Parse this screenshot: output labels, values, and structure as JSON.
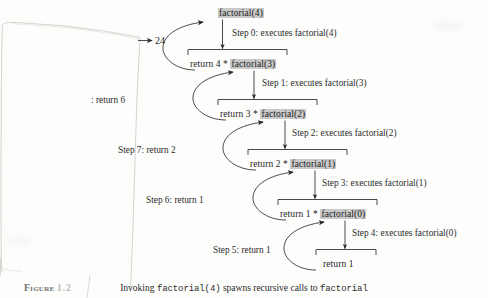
{
  "figure": {
    "label_word": "Figure",
    "label_number": "1.2",
    "caption_pre": "Invoking ",
    "caption_code1": "factorial(4)",
    "caption_mid": " spawns recursive calls to ",
    "caption_code2": "factorial",
    "caption_full": "Invoking factorial(4) spawns recursive calls to factorial"
  },
  "colors": {
    "highlight": "#c9c9c9",
    "ink": "#262626",
    "page_edge": "#cfcfcb",
    "paper": "#fdfdfc"
  },
  "diagram": {
    "type": "recursion-call-tree",
    "root_value": "24",
    "nodes": [
      {
        "id": "call4",
        "prefix": "",
        "code": "factorial(4)",
        "suffix": ""
      },
      {
        "id": "body4",
        "prefix": "return 4 * ",
        "code": "factorial(3)",
        "suffix": ""
      },
      {
        "id": "body3",
        "prefix": "return 3 * ",
        "code": "factorial(2)",
        "suffix": ""
      },
      {
        "id": "body2",
        "prefix": "return 2 * ",
        "code": "factorial(1)",
        "suffix": ""
      },
      {
        "id": "body1",
        "prefix": "return 1 * ",
        "code": "factorial(0)",
        "suffix": ""
      },
      {
        "id": "body0",
        "prefix": "return 1",
        "code": "",
        "suffix": ""
      }
    ],
    "step_labels": [
      {
        "id": "step0",
        "text": "Step 0: executes factorial(4)"
      },
      {
        "id": "step1",
        "text": "Step 1: executes factorial(3)"
      },
      {
        "id": "step2",
        "text": "Step 2: executes factorial(2)"
      },
      {
        "id": "step3",
        "text": "Step 3: executes factorial(1)"
      },
      {
        "id": "step4",
        "text": "Step 4: executes factorial(0)"
      }
    ],
    "return_labels": [
      {
        "id": "ret8",
        "text": ": return 6"
      },
      {
        "id": "ret7",
        "text": "Step 7: return 2"
      },
      {
        "id": "ret6",
        "text": "Step 6: return 1"
      },
      {
        "id": "ret5",
        "text": "Step 5: return 1"
      }
    ],
    "final_result": "24"
  }
}
